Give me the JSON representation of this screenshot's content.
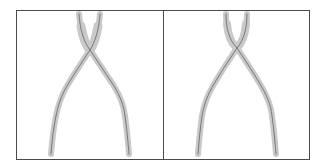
{
  "figure": {
    "colors": {
      "background": "#ffffff",
      "frame": "#4a4a4a",
      "halo": "#c9c9c9",
      "centerline": "#6e6e6e"
    },
    "panels": [
      {
        "id": "left",
        "label": "",
        "subject": "pliers"
      },
      {
        "id": "right",
        "label": "",
        "subject": "pliers"
      }
    ]
  }
}
